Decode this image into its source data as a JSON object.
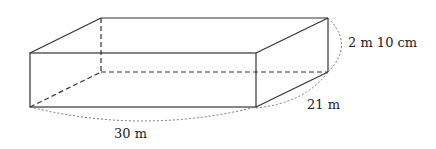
{
  "diagram": {
    "type": "rectangular-prism",
    "labels": {
      "length": "30 m",
      "width": "21 m",
      "height": "2 m 10 cm"
    },
    "colors": {
      "edge": "#333333",
      "hidden_edge": "#333333",
      "dimension_arc": "#777777"
    }
  }
}
